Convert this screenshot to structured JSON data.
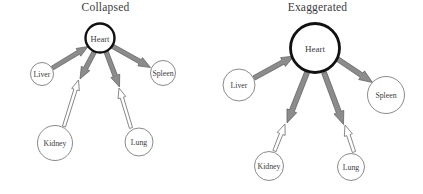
{
  "figure": {
    "background_color": "#ffffff",
    "width": 423,
    "height": 194
  },
  "style": {
    "outgoing_arrow_fill": "#8c8c8c",
    "outgoing_arrow_stroke": "#5a5a5a",
    "incoming_arrow_fill": "#ffffff",
    "incoming_arrow_stroke": "#7a7a7a",
    "hub_node_stroke": "#111111",
    "leaf_node_stroke": "#7d7d7d",
    "node_fill": "#ffffff",
    "label_color": "#3c3c3c",
    "title_color": "#3b3b3b"
  },
  "panels": [
    {
      "id": "collapsed",
      "title": "Collapsed",
      "hub": {
        "label": "Heart",
        "cx": 100,
        "cy": 38,
        "r": 14.5,
        "stroke_width": 2.4,
        "font_size": 8.5
      },
      "nodes": [
        {
          "id": "liver",
          "label": "Liver",
          "cx": 42,
          "cy": 74,
          "r": 11.5,
          "font_size": 7.8,
          "direction": "to-hub",
          "arrow_style": "filled"
        },
        {
          "id": "spleen",
          "label": "Spleen",
          "cx": 163,
          "cy": 73,
          "r": 12.5,
          "font_size": 7.8,
          "direction": "from-hub",
          "arrow_style": "filled"
        },
        {
          "id": "kidney",
          "label": "Kidney",
          "cx": 55,
          "cy": 143,
          "r": 17.5,
          "font_size": 7.8,
          "direction": "to-hub",
          "arrow_style": "hollow"
        },
        {
          "id": "lung",
          "label": "Lung",
          "cx": 139,
          "cy": 142,
          "r": 14.0,
          "font_size": 7.8,
          "direction": "to-hub",
          "arrow_style": "hollow"
        }
      ]
    },
    {
      "id": "exaggerated",
      "title": "Exaggerated",
      "hub": {
        "label": "Heart",
        "cx": 103,
        "cy": 48,
        "r": 24.5,
        "stroke_width": 2.8,
        "font_size": 9.0
      },
      "nodes": [
        {
          "id": "liver",
          "label": "Liver",
          "cx": 27,
          "cy": 85,
          "r": 16.0,
          "font_size": 7.8,
          "direction": "to-hub",
          "arrow_style": "filled"
        },
        {
          "id": "spleen",
          "label": "Spleen",
          "cx": 174,
          "cy": 95,
          "r": 18.5,
          "font_size": 7.8,
          "direction": "from-hub",
          "arrow_style": "filled"
        },
        {
          "id": "kidney",
          "label": "Kidney",
          "cx": 57,
          "cy": 166,
          "r": 14.5,
          "font_size": 7.8,
          "direction": "to-hub",
          "arrow_style": "hollow"
        },
        {
          "id": "lung",
          "label": "Lung",
          "cx": 139,
          "cy": 167,
          "r": 13.5,
          "font_size": 7.8,
          "direction": "to-hub",
          "arrow_style": "hollow"
        }
      ]
    }
  ],
  "edges": {
    "collapsed": [
      {
        "id": "liver-heart",
        "from": "liver",
        "to": "heart",
        "arrow_style": "filled",
        "tail_x": 52.5,
        "tail_y": 68.0,
        "head_x": 88.0,
        "head_y": 46.5,
        "tail_w": 4.2,
        "head_w": 9.0
      },
      {
        "id": "heart-spleen",
        "from": "heart",
        "to": "spleen",
        "arrow_style": "filled",
        "tail_x": 112.0,
        "tail_y": 46.0,
        "head_x": 150.5,
        "head_y": 67.5,
        "tail_w": 4.4,
        "head_w": 9.5
      },
      {
        "id": "heart-kidney",
        "from": "heart",
        "to": "kidney",
        "arrow_style": "filled",
        "tail_x": 94.5,
        "tail_y": 51.5,
        "head_x": 80.0,
        "head_y": 79.0,
        "tail_w": 4.4,
        "head_w": 9.5
      },
      {
        "id": "kidney-heart",
        "from": "kidney",
        "to": "heart",
        "arrow_style": "hollow",
        "tail_x": 64.0,
        "tail_y": 126.5,
        "head_x": 78.5,
        "head_y": 80.0,
        "tail_w": 3.2,
        "head_w": 8.0
      },
      {
        "id": "heart-lung",
        "from": "heart",
        "to": "lung",
        "arrow_style": "filled",
        "tail_x": 106.0,
        "tail_y": 51.5,
        "head_x": 119.5,
        "head_y": 87.0,
        "tail_w": 4.4,
        "head_w": 9.5
      },
      {
        "id": "lung-heart",
        "from": "lung",
        "to": "heart",
        "arrow_style": "hollow",
        "tail_x": 131.0,
        "tail_y": 128.0,
        "head_x": 119.0,
        "head_y": 88.0,
        "tail_w": 3.2,
        "head_w": 8.0
      }
    ],
    "exaggerated": [
      {
        "id": "liver-heart",
        "from": "liver",
        "to": "heart",
        "arrow_style": "filled",
        "tail_x": 42.0,
        "tail_y": 78.0,
        "head_x": 82.0,
        "head_y": 56.0,
        "tail_w": 4.6,
        "head_w": 10.0
      },
      {
        "id": "heart-spleen",
        "from": "heart",
        "to": "spleen",
        "arrow_style": "filled",
        "tail_x": 124.0,
        "tail_y": 58.0,
        "head_x": 160.5,
        "head_y": 82.5,
        "tail_w": 4.8,
        "head_w": 10.5
      },
      {
        "id": "heart-kidney",
        "from": "heart",
        "to": "kidney",
        "arrow_style": "filled",
        "tail_x": 95.0,
        "tail_y": 72.5,
        "head_x": 75.0,
        "head_y": 123.0,
        "tail_w": 5.0,
        "head_w": 10.5
      },
      {
        "id": "kidney-heart",
        "from": "kidney",
        "to": "heart",
        "arrow_style": "hollow",
        "tail_x": 62.5,
        "tail_y": 151.0,
        "head_x": 73.0,
        "head_y": 124.0,
        "tail_w": 3.4,
        "head_w": 8.5
      },
      {
        "id": "heart-lung",
        "from": "heart",
        "to": "lung",
        "arrow_style": "filled",
        "tail_x": 112.0,
        "tail_y": 72.5,
        "head_x": 131.5,
        "head_y": 124.5,
        "tail_w": 5.0,
        "head_w": 10.5
      },
      {
        "id": "lung-heart",
        "from": "lung",
        "to": "heart",
        "arrow_style": "hollow",
        "tail_x": 142.0,
        "tail_y": 152.0,
        "head_x": 133.0,
        "head_y": 125.0,
        "tail_w": 3.4,
        "head_w": 8.5
      }
    ]
  }
}
